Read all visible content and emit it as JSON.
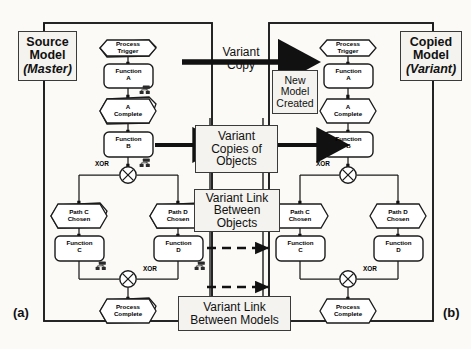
{
  "figure": {
    "caption_left": "(a)",
    "caption_right": "(b)",
    "colors": {
      "ink": "#111111",
      "panel_fill": "#f4f3ef",
      "page": "#fbfaf7"
    }
  },
  "panels": {
    "left": {
      "title_line1": "Source",
      "title_line2": "Model",
      "title_line3": "(Master)"
    },
    "right": {
      "title_line1": "Copied",
      "title_line2": "Model",
      "title_line3": "(Variant)"
    }
  },
  "annotations": {
    "variant_copy": {
      "line1": "Variant",
      "line2": "Copy"
    },
    "new_model_created": {
      "line1": "New",
      "line2": "Model",
      "line3": "Created"
    },
    "variant_copies_of_objects": {
      "line1": "Variant",
      "line2": "Copies of",
      "line3": "Objects"
    },
    "variant_link_between_objects": {
      "line1": "Variant Link",
      "line2": "Between",
      "line3": "Objects"
    },
    "variant_link_between_models": {
      "line1": "Variant Link",
      "line2": "Between Models"
    }
  },
  "epc": {
    "xor_label": "XOR",
    "left_model": {
      "events": [
        {
          "id": "process-trigger",
          "line1": "Process",
          "line2": "Trigger"
        },
        {
          "id": "a-complete",
          "line1": "A",
          "line2": "Complete"
        },
        {
          "id": "path-c-chosen",
          "line1": "Path C",
          "line2": "Chosen"
        },
        {
          "id": "path-d-chosen",
          "line1": "Path D",
          "line2": "Chosen"
        },
        {
          "id": "process-complete",
          "line1": "Process",
          "line2": "Complete"
        }
      ],
      "functions": [
        {
          "id": "function-a",
          "line1": "Function",
          "line2": "A",
          "org_unit": true
        },
        {
          "id": "function-b",
          "line1": "Function",
          "line2": "B",
          "org_unit": true
        },
        {
          "id": "function-c",
          "line1": "Function",
          "line2": "C",
          "org_unit": true
        },
        {
          "id": "function-d",
          "line1": "Function",
          "line2": "D",
          "org_unit": true
        }
      ],
      "connectors": [
        {
          "id": "xor-split",
          "type": "XOR"
        },
        {
          "id": "xor-join",
          "type": "XOR"
        }
      ]
    },
    "right_model": {
      "events": [
        {
          "id": "process-trigger",
          "line1": "Process",
          "line2": "Trigger"
        },
        {
          "id": "a-complete",
          "line1": "A",
          "line2": "Complete"
        },
        {
          "id": "path-c-chosen",
          "line1": "Path C",
          "line2": "Chosen"
        },
        {
          "id": "path-d-chosen",
          "line1": "Path D",
          "line2": "Chosen"
        },
        {
          "id": "process-complete",
          "line1": "Process",
          "line2": "Complete"
        }
      ],
      "functions": [
        {
          "id": "function-a",
          "line1": "Function",
          "line2": "A",
          "org_unit": false
        },
        {
          "id": "function-b",
          "line1": "Function",
          "line2": "B",
          "org_unit": false
        },
        {
          "id": "function-c",
          "line1": "Function",
          "line2": "C",
          "org_unit": false
        },
        {
          "id": "function-d",
          "line1": "Function",
          "line2": "D",
          "org_unit": false
        }
      ],
      "connectors": [
        {
          "id": "xor-split",
          "type": "XOR"
        },
        {
          "id": "xor-join",
          "type": "XOR"
        }
      ]
    }
  }
}
